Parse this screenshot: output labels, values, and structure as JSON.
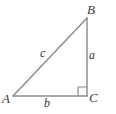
{
  "figure": {
    "type": "right-triangle-diagram",
    "stroke_color": "#8a8a8a",
    "label_color": "#3a3a3a",
    "background_color": "#ffffff",
    "vertices": [
      {
        "name": "A",
        "label": "A",
        "x": 13,
        "y": 96,
        "position": "bottom-left"
      },
      {
        "name": "B",
        "label": "B",
        "x": 87,
        "y": 18,
        "position": "top-right"
      },
      {
        "name": "C",
        "label": "C",
        "x": 87,
        "y": 96,
        "position": "bottom-right"
      }
    ],
    "sides": [
      {
        "name": "a",
        "label": "a",
        "from": "B",
        "to": "C",
        "orientation": "vertical"
      },
      {
        "name": "b",
        "label": "b",
        "from": "A",
        "to": "C",
        "orientation": "horizontal"
      },
      {
        "name": "c",
        "label": "c",
        "from": "A",
        "to": "B",
        "orientation": "hypotenuse"
      }
    ],
    "right_angle": {
      "at_vertex": "C",
      "marker": "square",
      "size": 9
    }
  }
}
